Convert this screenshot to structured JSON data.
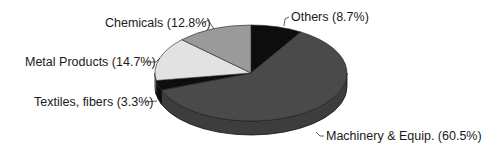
{
  "chart_data": {
    "type": "pie",
    "style": "3d-oval",
    "title": "",
    "start_angle_deg": 0,
    "direction": "clockwise",
    "slices": [
      {
        "name": "Others",
        "value": 8.7,
        "label": "Others (8.7%)",
        "color": "#0d0d0d"
      },
      {
        "name": "Machinery & Equip.",
        "value": 60.5,
        "label": "Machinery & Equip. (60.5%)",
        "color": "#4a4a4a"
      },
      {
        "name": "Textiles, fibers",
        "value": 3.3,
        "label": "Textiles, fibers (3.3%)",
        "color": "#0d0d0d"
      },
      {
        "name": "Metal Products",
        "value": 14.7,
        "label": "Metal Products (14.7%)",
        "color": "#e2e2e2"
      },
      {
        "name": "Chemicals",
        "value": 12.8,
        "label": "Chemicals (12.8%)",
        "color": "#9a9a9a"
      }
    ],
    "legend": "none (callout labels with leader lines)",
    "units": "%"
  },
  "labels": {
    "others": "Others (8.7%)",
    "machinery": "Machinery & Equip. (60.5%)",
    "textiles": "Textiles, fibers (3.3%)",
    "metal": "Metal Products (14.7%)",
    "chemicals": "Chemicals (12.8%)"
  }
}
